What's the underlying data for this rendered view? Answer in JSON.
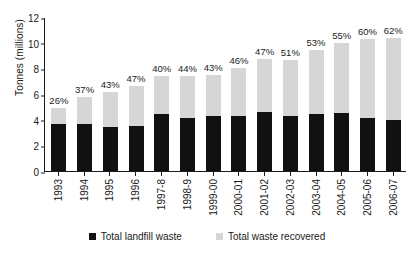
{
  "chart_data": {
    "type": "bar",
    "title": "",
    "subtitle": "",
    "xlabel": "",
    "ylabel": "Tonnes (millions)",
    "ylim": [
      0,
      12
    ],
    "yticks": [
      12,
      10,
      8,
      6,
      4,
      2,
      0
    ],
    "grid": false,
    "stacked": true,
    "legend_position": "bottom",
    "categories": [
      "1993",
      "1994",
      "1995",
      "1996",
      "1997-8",
      "1998-9",
      "1999-00",
      "2000-01",
      "2001-02",
      "2002-03",
      "2003-04",
      "2004-05",
      "2005-06",
      "2006-07"
    ],
    "series": [
      {
        "name": "Total landfill waste",
        "color": "#111111",
        "values": [
          3.65,
          3.7,
          3.45,
          3.5,
          4.45,
          4.15,
          4.25,
          4.3,
          4.6,
          4.25,
          4.45,
          4.5,
          4.1,
          3.95
        ]
      },
      {
        "name": "Total waste recovered",
        "color": "#d6d6d6",
        "values": [
          1.3,
          2.05,
          2.7,
          3.1,
          2.95,
          3.25,
          3.2,
          3.7,
          4.1,
          4.4,
          5.0,
          5.5,
          6.15,
          6.45
        ]
      }
    ],
    "totals": [
      4.95,
      5.75,
      6.15,
      6.6,
      7.4,
      7.4,
      7.45,
      8.0,
      8.7,
      8.65,
      9.45,
      10.0,
      10.25,
      10.4
    ],
    "annotations": {
      "label": "recovery rate (% of total waste recovered)",
      "values": [
        "26%",
        "37%",
        "43%",
        "47%",
        "40%",
        "44%",
        "43%",
        "46%",
        "47%",
        "51%",
        "53%",
        "55%",
        "60%",
        "62%"
      ]
    }
  },
  "legend": {
    "items": [
      {
        "label": "Total landfill waste",
        "color": "#111111"
      },
      {
        "label": "Total waste recovered",
        "color": "#d6d6d6"
      }
    ]
  }
}
